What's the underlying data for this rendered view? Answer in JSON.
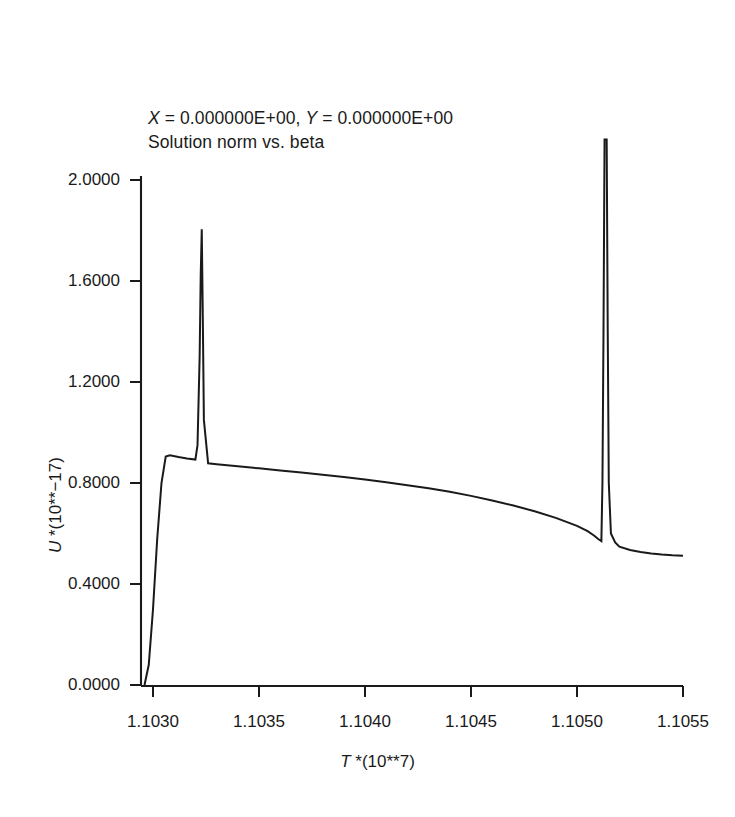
{
  "figure": {
    "title_lines": [
      "X = 0.000000E+00, Y = 0.000000E+00",
      "Solution norm vs. beta"
    ],
    "title_x_symbol": "X",
    "title_y_symbol": "Y",
    "title_x_value": " = 0.000000E+00, ",
    "title_y_value": " = 0.000000E+00",
    "subtitle": "Solution norm vs. beta",
    "line_color": "#1a1a1a",
    "axis_color": "#1a1a1a",
    "background": "#ffffff"
  },
  "axes": {
    "ylabel_symbol": "U",
    "ylabel_rest": " *(10**−17)",
    "ylabel_full": "U *(10**−17)",
    "xlabel_symbol": "T",
    "xlabel_rest": " *(10**7)",
    "xlabel_full": "T *(10**7)",
    "ytick_labels": [
      "2.0000",
      "1.6000",
      "1.2000",
      "0.8000",
      "0.4000",
      "0.0000"
    ],
    "xtick_labels": [
      "1.1030",
      "1.1035",
      "1.1040",
      "1.1045",
      "1.1050",
      "1.1055"
    ]
  },
  "chart_data": {
    "type": "line",
    "title": "X = 0.000000E+00, Y = 0.000000E+00",
    "subtitle": "Solution norm vs. beta",
    "xlabel": "T *(10**7)",
    "ylabel": "U *(10**-17)",
    "xlim": [
      1.10285,
      1.10555
    ],
    "ylim": [
      0.0,
      2.0
    ],
    "xticks": [
      1.103,
      1.1035,
      1.104,
      1.1045,
      1.105,
      1.1055
    ],
    "yticks": [
      0.0,
      0.4,
      0.8,
      1.2,
      1.6,
      2.0
    ],
    "grid": false,
    "legend": null,
    "clipped_at_top": true,
    "series": [
      {
        "name": "Solution norm",
        "x": [
          1.10296,
          1.10298,
          1.103,
          1.10302,
          1.10304,
          1.10306,
          1.10308,
          1.10312,
          1.10316,
          1.1032,
          1.10321,
          1.10322,
          1.103225,
          1.10323,
          1.103235,
          1.10324,
          1.10326,
          1.1033,
          1.1034,
          1.1035,
          1.1036,
          1.1037,
          1.1038,
          1.1039,
          1.104,
          1.1041,
          1.1042,
          1.1043,
          1.1044,
          1.1045,
          1.1046,
          1.1047,
          1.1048,
          1.1049,
          1.105,
          1.10505,
          1.10508,
          1.1051,
          1.105115,
          1.10512,
          1.105125,
          1.10513,
          1.105135,
          1.10514,
          1.105145,
          1.10515,
          1.10516,
          1.10518,
          1.1052,
          1.10525,
          1.1053,
          1.10535,
          1.1054,
          1.10545,
          1.1055
        ],
        "y": [
          0.0,
          0.08,
          0.3,
          0.58,
          0.8,
          0.905,
          0.91,
          0.903,
          0.897,
          0.893,
          0.95,
          1.3,
          1.62,
          1.805,
          1.45,
          1.05,
          0.878,
          0.874,
          0.866,
          0.858,
          0.85,
          0.842,
          0.833,
          0.824,
          0.814,
          0.803,
          0.791,
          0.779,
          0.765,
          0.749,
          0.731,
          0.711,
          0.688,
          0.662,
          0.63,
          0.609,
          0.592,
          0.578,
          0.57,
          0.8,
          1.4,
          2.0,
          2.0,
          2.0,
          1.4,
          0.8,
          0.6,
          0.565,
          0.548,
          0.535,
          0.527,
          0.521,
          0.517,
          0.514,
          0.512
        ]
      }
    ],
    "annotations": [
      {
        "label": "first-spike-peak",
        "x": 1.10323,
        "y": 1.805
      },
      {
        "label": "plateau-start",
        "x": 1.10306,
        "y": 0.91
      },
      {
        "label": "second-spike-divergence",
        "x": 1.10513,
        "y": null
      },
      {
        "label": "curve-end",
        "x": 1.1055,
        "y": 0.512
      }
    ]
  }
}
